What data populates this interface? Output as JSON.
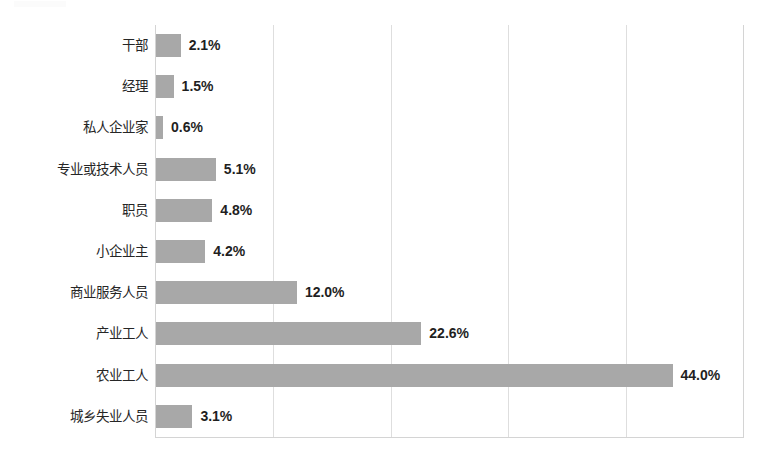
{
  "chart_data": {
    "type": "bar",
    "orientation": "horizontal",
    "title": "",
    "subtitle": "",
    "xlabel": "",
    "ylabel": "",
    "xlim": [
      0,
      50
    ],
    "grid": true,
    "gridlines_every": 10,
    "legend": "none",
    "value_suffix": "%",
    "bar_color": "#a8a8a8",
    "gridline_color": "#dedede",
    "border_color": "#d4d4d4",
    "label_color": "#262626",
    "value_color": "#1f1f1f",
    "categories": [
      "干部",
      "经理",
      "私人企业家",
      "专业或技术人员",
      "职员",
      "小企业主",
      "商业服务人员",
      "产业工人",
      "农业工人",
      "城乡失业人员"
    ],
    "values": [
      2.1,
      1.5,
      0.6,
      5.1,
      4.8,
      4.2,
      12.0,
      22.6,
      44.0,
      3.1
    ],
    "value_labels": [
      "2.1%",
      "1.5%",
      "0.6%",
      "5.1%",
      "4.8%",
      "4.2%",
      "12.0%",
      "22.6%",
      "44.0%",
      "3.1%"
    ],
    "axis_ticks": [
      0,
      10,
      20,
      30,
      40,
      50
    ],
    "tick_labels": [
      "",
      "",
      "",
      "",
      "",
      ""
    ]
  }
}
